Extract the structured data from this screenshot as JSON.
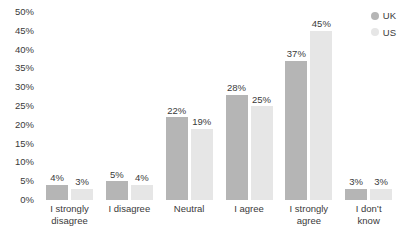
{
  "chart_data": {
    "type": "bar",
    "title": "",
    "xlabel": "",
    "ylabel": "",
    "ylim": [
      0,
      50
    ],
    "ytick_step": 5,
    "grid": false,
    "legend_position": "top-right",
    "categories": [
      "I strongly\ndisagree",
      "I disagree",
      "Neutral",
      "I agree",
      "I strongly\nagree",
      "I don’t\nknow"
    ],
    "ytick_labels": [
      "50%",
      "45%",
      "40%",
      "35%",
      "30%",
      "25%",
      "20%",
      "15%",
      "10%",
      "5%",
      "0%"
    ],
    "ytick_values": [
      50,
      45,
      40,
      35,
      30,
      25,
      20,
      15,
      10,
      5,
      0
    ],
    "series": [
      {
        "name": "UK",
        "color": "#b5b5b5",
        "values": [
          4,
          5,
          22,
          28,
          37,
          3
        ],
        "value_labels": [
          "4%",
          "5%",
          "22%",
          "28%",
          "37%",
          "3%"
        ]
      },
      {
        "name": "US",
        "color": "#e6e6e6",
        "values": [
          3,
          4,
          19,
          25,
          45,
          3
        ],
        "value_labels": [
          "3%",
          "4%",
          "19%",
          "25%",
          "45%",
          "3%"
        ]
      }
    ]
  }
}
